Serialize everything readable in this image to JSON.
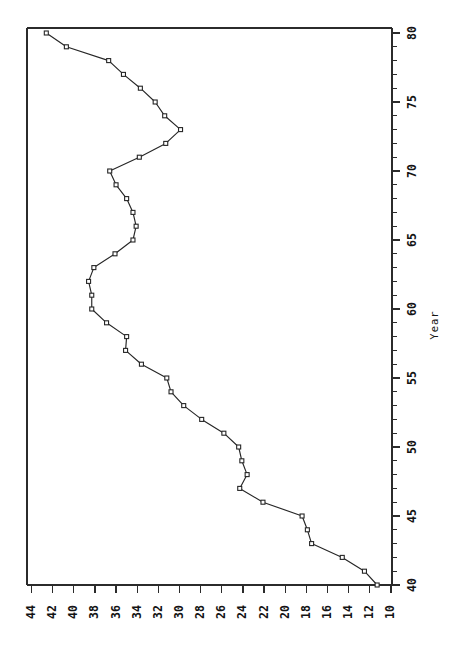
{
  "chart_data": {
    "type": "line",
    "title": "",
    "subtitle": "",
    "orientation": "rotated-90-clockwise",
    "xlabel": "Year",
    "ylabel": "",
    "xlim": [
      40,
      81
    ],
    "ylim": [
      10,
      44
    ],
    "x_tick_labels": [
      "40",
      "45",
      "50",
      "55",
      "60",
      "65",
      "70",
      "75",
      "80"
    ],
    "x_major_ticks": [
      40,
      45,
      50,
      55,
      60,
      65,
      70,
      75,
      80
    ],
    "x_minor_tick_step": 1,
    "y_tick_labels": [
      "44",
      "42",
      "40",
      "38",
      "36",
      "34",
      "32",
      "30",
      "28",
      "26",
      "24",
      "22",
      "20",
      "18",
      "16",
      "14",
      "12",
      "10"
    ],
    "y_major_ticks": [
      44,
      42,
      40,
      38,
      36,
      34,
      32,
      30,
      28,
      26,
      24,
      22,
      20,
      18,
      16,
      14,
      12,
      10
    ],
    "y_axis_direction": "descending-left-to-right",
    "grid": false,
    "legend": false,
    "legend_position": "none",
    "marker": "square-open",
    "line_color": "#262626",
    "marker_fill": "#ffffff",
    "marker_edge": "#262626",
    "background": "#ffffff",
    "x": [
      40,
      41,
      42,
      43,
      44,
      45,
      46,
      47,
      48,
      49,
      50,
      51,
      52,
      53,
      54,
      55,
      56,
      57,
      58,
      59,
      60,
      61,
      62,
      63,
      64,
      65,
      66,
      67,
      68,
      69,
      70,
      71,
      72,
      73,
      74,
      75,
      76,
      77,
      78,
      79,
      80
    ],
    "values": [
      11.3,
      12.5,
      14.6,
      17.5,
      17.9,
      18.4,
      22.1,
      24.3,
      23.6,
      24.1,
      24.4,
      25.8,
      27.9,
      29.6,
      30.8,
      31.2,
      33.6,
      35.1,
      35.0,
      36.9,
      38.3,
      38.3,
      38.6,
      38.1,
      36.1,
      34.4,
      34.1,
      34.4,
      35.0,
      36.0,
      36.6,
      33.8,
      31.3,
      29.9,
      31.4,
      32.3,
      33.7,
      35.3,
      36.7,
      40.7,
      42.6
    ],
    "series": [
      {
        "name": "series-1",
        "x": [
          40,
          41,
          42,
          43,
          44,
          45,
          46,
          47,
          48,
          49,
          50,
          51,
          52,
          53,
          54,
          55,
          56,
          57,
          58,
          59,
          60,
          61,
          62,
          63,
          64,
          65,
          66,
          67,
          68,
          69,
          70,
          71,
          72,
          73,
          74,
          75,
          76,
          77,
          78,
          79,
          80
        ],
        "values": [
          11.3,
          12.5,
          14.6,
          17.5,
          17.9,
          18.4,
          22.1,
          24.3,
          23.6,
          24.1,
          24.4,
          25.8,
          27.9,
          29.6,
          30.8,
          31.2,
          33.6,
          35.1,
          35.0,
          36.9,
          38.3,
          38.3,
          38.6,
          38.1,
          36.1,
          34.4,
          34.1,
          34.4,
          35.0,
          36.0,
          36.6,
          33.8,
          31.3,
          29.9,
          31.4,
          32.3,
          33.7,
          35.3,
          36.7,
          40.7,
          42.6
        ]
      }
    ],
    "annotations": []
  },
  "axes": {
    "year_axis_title": "Year"
  }
}
